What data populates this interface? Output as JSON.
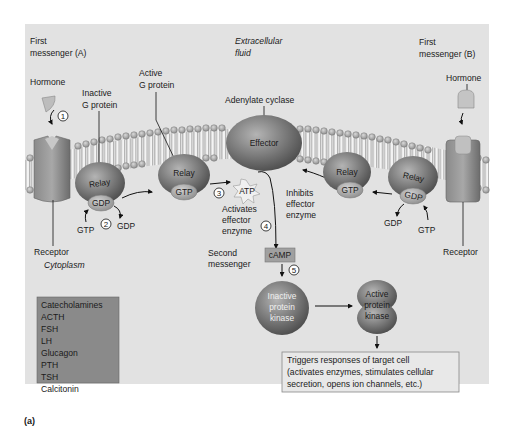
{
  "figure": {
    "caption": "(a)",
    "colors": {
      "panel_bg": "#e2e2e2",
      "membrane_head": "#9a9a9a",
      "protein_dark": "#5a5a5a",
      "protein_light": "#8c8c8c",
      "hormone_box_bg": "#8a8a8a",
      "page_bg": "#ffffff"
    }
  },
  "labels": {
    "first_messenger_a_line1": "First",
    "first_messenger_a_line2": "messenger (A)",
    "first_messenger_b_line1": "First",
    "first_messenger_b_line2": "messenger (B)",
    "extracellular_line1": "Extracellular",
    "extracellular_line2": "fluid",
    "cytoplasm": "Cytoplasm",
    "hormone_a": "Hormone",
    "hormone_b": "Hormone",
    "inactive_g_line1": "Inactive",
    "inactive_g_line2": "G protein",
    "active_g_line1": "Active",
    "active_g_line2": "G protein",
    "adenylate_cyclase": "Adenylate cyclase",
    "receptor_a": "Receptor",
    "receptor_b": "Receptor",
    "activates_line1": "Activates",
    "activates_line2": "effector",
    "activates_line3": "enzyme",
    "inhibits_line1": "Inhibits",
    "inhibits_line2": "effector",
    "inhibits_line3": "enzyme",
    "second_messenger_line1": "Second",
    "second_messenger_line2": "messenger"
  },
  "molecules": {
    "relay": "Relay",
    "effector": "Effector",
    "gdp": "GDP",
    "gtp": "GTP",
    "atp": "ATP",
    "camp": "cAMP",
    "inactive_kinase_line1": "Inactive",
    "inactive_kinase_line2": "protein",
    "inactive_kinase_line3": "kinase",
    "active_kinase_line1": "Active",
    "active_kinase_line2": "protein",
    "active_kinase_line3": "kinase"
  },
  "steps": [
    "1",
    "2",
    "3",
    "4",
    "5"
  ],
  "hormone_list": [
    "Catecholamines",
    "ACTH",
    "FSH",
    "LH",
    "Glucagon",
    "PTH",
    "TSH",
    "Calcitonin"
  ],
  "response_box": {
    "line1": "Triggers responses of target cell",
    "line2": "(activates enzymes, stimulates cellular",
    "line3": "secretion, opens ion channels, etc.)"
  }
}
